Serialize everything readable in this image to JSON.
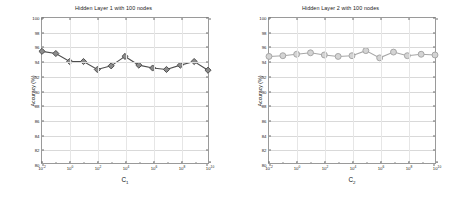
{
  "figure": {
    "panels": [
      "left",
      "right"
    ]
  },
  "chart_data": [
    {
      "type": "line",
      "title": "Hidden Layer 1 with 100 nodes",
      "xlabel": "C_1",
      "xlabel_base": "C",
      "xlabel_sub": "1",
      "ylabel": "Accuracy (%)",
      "marker": "diamond",
      "color": "#4d4d4d",
      "marker_face": "#8c8c8c",
      "grid": true,
      "legend": "none",
      "xscale": "log",
      "xlim": [
        -2,
        10
      ],
      "ylim": [
        80,
        100
      ],
      "yticks": [
        80,
        82,
        84,
        86,
        88,
        90,
        92,
        94,
        96,
        98,
        100
      ],
      "ytick_labels": [
        "80",
        "82",
        "84",
        "86",
        "88",
        "90",
        "92",
        "94",
        "96",
        "98",
        "100"
      ],
      "xtick_exponents": [
        -2,
        0,
        2,
        4,
        6,
        8,
        10
      ],
      "xtick_labels": [
        "10-2",
        "100",
        "102",
        "104",
        "106",
        "108",
        "1010"
      ],
      "x_exponents": [
        -2,
        -1,
        0,
        1,
        2,
        3,
        4,
        5,
        6,
        7,
        8,
        9,
        10
      ],
      "values": [
        95.4,
        95.1,
        94.0,
        94.0,
        92.9,
        93.4,
        94.7,
        93.5,
        93.1,
        92.9,
        93.5,
        94.0,
        92.8
      ]
    },
    {
      "type": "line",
      "title": "Hidden Layer 2 with 100 nodes",
      "xlabel": "C_2",
      "xlabel_base": "C",
      "xlabel_sub": "2",
      "ylabel": "Accuracy (%)",
      "marker": "circle",
      "color": "#a6a6a6",
      "marker_face": "#d4d4d4",
      "grid": true,
      "legend": "none",
      "xscale": "log",
      "xlim": [
        -2,
        10
      ],
      "ylim": [
        80,
        100
      ],
      "yticks": [
        80,
        82,
        84,
        86,
        88,
        90,
        92,
        94,
        96,
        98,
        100
      ],
      "ytick_labels": [
        "80",
        "82",
        "84",
        "86",
        "88",
        "90",
        "92",
        "94",
        "96",
        "98",
        "100"
      ],
      "xtick_exponents": [
        -2,
        0,
        2,
        4,
        6,
        8,
        10
      ],
      "xtick_labels": [
        "10-2",
        "100",
        "102",
        "104",
        "106",
        "108",
        "1010"
      ],
      "x_exponents": [
        -2,
        -1,
        0,
        1,
        2,
        3,
        4,
        5,
        6,
        7,
        8,
        9,
        10
      ],
      "values": [
        94.7,
        94.8,
        95.0,
        95.2,
        94.9,
        94.7,
        94.8,
        95.5,
        94.5,
        95.3,
        94.8,
        95.0,
        94.9
      ]
    }
  ]
}
